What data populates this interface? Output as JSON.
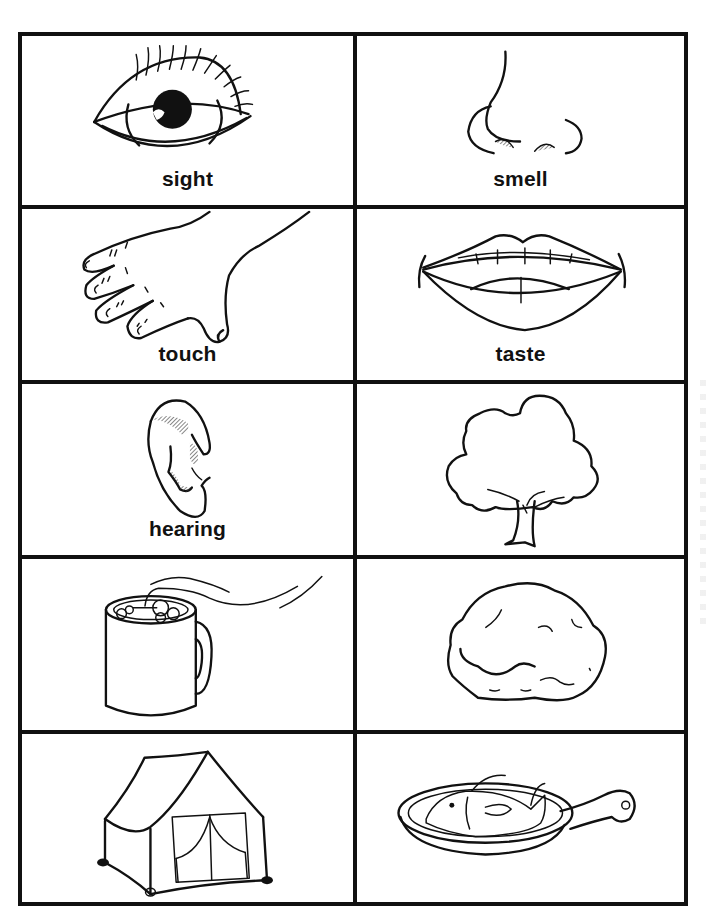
{
  "worksheet": {
    "title": "Five Senses Picture Cards",
    "layout": {
      "columns": 2,
      "rows": 5
    },
    "colors": {
      "line": "#111111",
      "background": "#ffffff"
    },
    "cards": [
      {
        "label": "sight",
        "picture": "eye-icon"
      },
      {
        "label": "smell",
        "picture": "nose-icon"
      },
      {
        "label": "touch",
        "picture": "hand-icon"
      },
      {
        "label": "taste",
        "picture": "mouth-icon"
      },
      {
        "label": "hearing",
        "picture": "ear-icon"
      },
      {
        "label": "",
        "picture": "tree-icon"
      },
      {
        "label": "",
        "picture": "hot-mug-icon"
      },
      {
        "label": "",
        "picture": "rock-icon"
      },
      {
        "label": "",
        "picture": "tent-icon"
      },
      {
        "label": "",
        "picture": "fish-in-pan-icon"
      }
    ]
  }
}
